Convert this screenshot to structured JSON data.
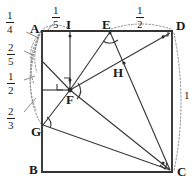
{
  "figure": {
    "stroke_color": "#333333",
    "dotted_color": "#8a8a8a",
    "background": "#ffffff"
  },
  "vertices": [
    {
      "name": "A",
      "label": "A",
      "x": 42,
      "y": 30,
      "text_x": 30,
      "text_y": 22
    },
    {
      "name": "B",
      "label": "B",
      "x": 42,
      "y": 172,
      "text_x": 29,
      "text_y": 164
    },
    {
      "name": "C",
      "label": "C",
      "x": 172,
      "y": 172,
      "text_x": 177,
      "text_y": 166
    },
    {
      "name": "D",
      "label": "D",
      "x": 172,
      "y": 32,
      "text_x": 176,
      "text_y": 20
    },
    {
      "name": "E",
      "label": "E",
      "x": 110,
      "y": 32,
      "text_x": 102,
      "text_y": 19
    },
    {
      "name": "F",
      "label": "F",
      "x": 70,
      "y": 90,
      "text_x": 66,
      "text_y": 94
    },
    {
      "name": "G",
      "label": "G",
      "x": 42,
      "y": 125,
      "text_x": 31,
      "text_y": 125
    },
    {
      "name": "H",
      "label": "H",
      "x": 124,
      "y": 63,
      "text_x": 113,
      "text_y": 67
    },
    {
      "name": "I",
      "label": "I",
      "x": 70,
      "y": 32,
      "text_x": 66,
      "text_y": 19
    }
  ],
  "measure_labels": [
    {
      "name": "one-quarter",
      "numerator": "1",
      "denominator": "4",
      "x": 8,
      "y": 14
    },
    {
      "name": "one-fifth",
      "numerator": "1",
      "denominator": "5",
      "x": 54,
      "y": 8
    },
    {
      "name": "one-half-top",
      "numerator": "1",
      "denominator": "2",
      "x": 138,
      "y": 8
    },
    {
      "name": "two-fifths",
      "numerator": "2",
      "denominator": "5",
      "x": 9,
      "y": 46
    },
    {
      "name": "one-half-left",
      "numerator": "1",
      "denominator": "2",
      "x": 9,
      "y": 75
    },
    {
      "name": "two-thirds",
      "numerator": "2",
      "denominator": "3",
      "x": 9,
      "y": 110
    },
    {
      "name": "unit-right",
      "numerator": "1",
      "denominator": "",
      "x": 184,
      "y": 94
    }
  ],
  "segments": [
    {
      "name": "side-AB",
      "from": "A",
      "to": "B"
    },
    {
      "name": "side-BC",
      "from": "B",
      "to": "C"
    },
    {
      "name": "side-CD",
      "from": "C",
      "to": "D"
    },
    {
      "name": "side-DA",
      "from": "D",
      "to": "A"
    },
    {
      "name": "segment-IF",
      "from": "I",
      "to": "F"
    },
    {
      "name": "segment-EF",
      "from": "E",
      "to": "F"
    },
    {
      "name": "segment-EC",
      "from": "E",
      "to": "C"
    },
    {
      "name": "segment-FD",
      "from": "F",
      "to": "D"
    },
    {
      "name": "segment-FC",
      "from": "F",
      "to": "C"
    },
    {
      "name": "segment-FG",
      "from": "F",
      "to": "G"
    },
    {
      "name": "segment-GC",
      "from": "G",
      "to": "C"
    },
    {
      "name": "segment-AF",
      "from": "A",
      "to": "F"
    }
  ],
  "markers": [
    {
      "name": "right-angle-at-F",
      "kind": "right-angle"
    },
    {
      "name": "right-angle-at-D",
      "kind": "right-angle"
    },
    {
      "name": "right-angle-at-C",
      "kind": "right-angle"
    },
    {
      "name": "angle-arc-at-E",
      "kind": "angle-arc"
    },
    {
      "name": "angle-arc-at-F",
      "kind": "angle-arc"
    },
    {
      "name": "tick-on-EF",
      "kind": "tick"
    },
    {
      "name": "tick-on-FD",
      "kind": "tick"
    },
    {
      "name": "tick-on-EC",
      "kind": "tick"
    },
    {
      "name": "tick-on-IF",
      "kind": "tick"
    }
  ],
  "dotted_arcs": [
    {
      "name": "arc-top-AI",
      "description": "dotted arc spanning A to I along top edge"
    },
    {
      "name": "arc-top-ED",
      "description": "dotted arc spanning E to D along top edge"
    },
    {
      "name": "arc-right-DC",
      "description": "dotted arc spanning D to C along right edge"
    },
    {
      "name": "arc-left-AG",
      "description": "dotted arc bundle from A down the left edge to G"
    }
  ]
}
